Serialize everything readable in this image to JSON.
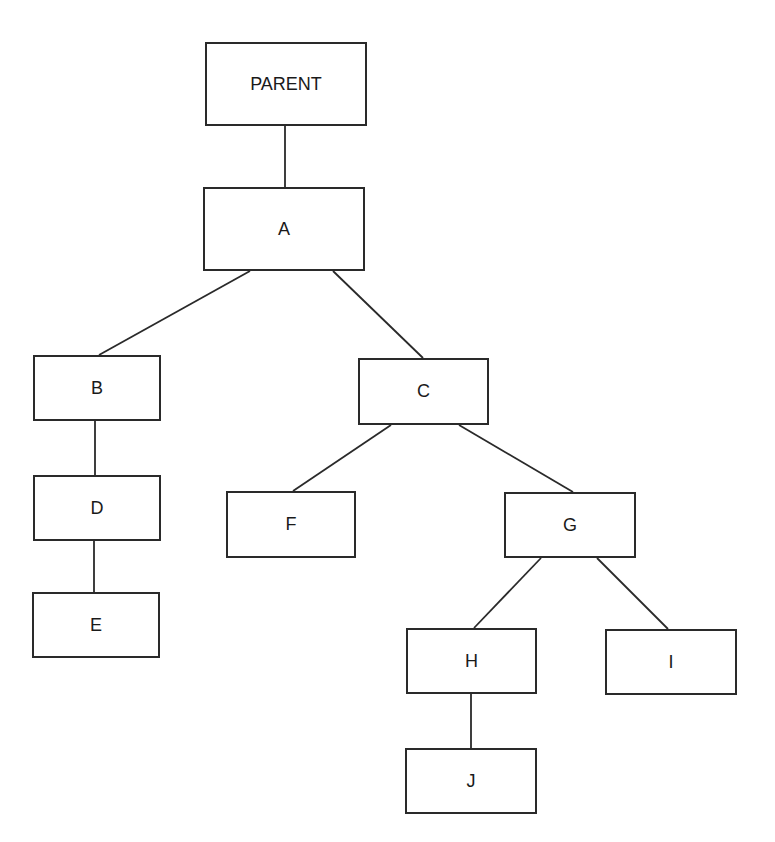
{
  "diagram": {
    "type": "tree",
    "nodes": [
      {
        "id": "PARENT",
        "label": "PARENT",
        "x": 205,
        "y": 42,
        "w": 162,
        "h": 84
      },
      {
        "id": "A",
        "label": "A",
        "x": 203,
        "y": 187,
        "w": 162,
        "h": 84
      },
      {
        "id": "B",
        "label": "B",
        "x": 33,
        "y": 355,
        "w": 128,
        "h": 66
      },
      {
        "id": "C",
        "label": "C",
        "x": 358,
        "y": 358,
        "w": 131,
        "h": 67
      },
      {
        "id": "D",
        "label": "D",
        "x": 33,
        "y": 475,
        "w": 128,
        "h": 66
      },
      {
        "id": "E",
        "label": "E",
        "x": 32,
        "y": 592,
        "w": 128,
        "h": 66
      },
      {
        "id": "F",
        "label": "F",
        "x": 226,
        "y": 491,
        "w": 130,
        "h": 67
      },
      {
        "id": "G",
        "label": "G",
        "x": 504,
        "y": 492,
        "w": 132,
        "h": 66
      },
      {
        "id": "H",
        "label": "H",
        "x": 406,
        "y": 628,
        "w": 131,
        "h": 66
      },
      {
        "id": "I",
        "label": "I",
        "x": 605,
        "y": 629,
        "w": 132,
        "h": 66
      },
      {
        "id": "J",
        "label": "J",
        "x": 405,
        "y": 748,
        "w": 132,
        "h": 66
      }
    ],
    "edges": [
      {
        "from": "PARENT",
        "to": "A",
        "x1": 285,
        "y1": 126,
        "x2": 285,
        "y2": 187
      },
      {
        "from": "A",
        "to": "B",
        "x1": 250,
        "y1": 271,
        "x2": 99,
        "y2": 355
      },
      {
        "from": "A",
        "to": "C",
        "x1": 333,
        "y1": 271,
        "x2": 423,
        "y2": 358
      },
      {
        "from": "B",
        "to": "D",
        "x1": 95,
        "y1": 421,
        "x2": 95,
        "y2": 475
      },
      {
        "from": "D",
        "to": "E",
        "x1": 94,
        "y1": 541,
        "x2": 94,
        "y2": 592
      },
      {
        "from": "C",
        "to": "F",
        "x1": 391,
        "y1": 425,
        "x2": 293,
        "y2": 491
      },
      {
        "from": "C",
        "to": "G",
        "x1": 459,
        "y1": 425,
        "x2": 573,
        "y2": 492
      },
      {
        "from": "G",
        "to": "H",
        "x1": 541,
        "y1": 558,
        "x2": 474,
        "y2": 628
      },
      {
        "from": "G",
        "to": "I",
        "x1": 597,
        "y1": 558,
        "x2": 668,
        "y2": 629
      },
      {
        "from": "H",
        "to": "J",
        "x1": 471,
        "y1": 694,
        "x2": 471,
        "y2": 748
      }
    ]
  }
}
